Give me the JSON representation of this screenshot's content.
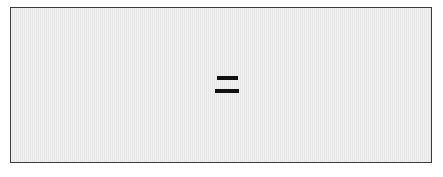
{
  "panel": {
    "name": "equals-panel",
    "background_color": "#e8e8e8",
    "border_color": "#3a3a3a",
    "outer_background_color": "#ffffff",
    "width_px": 443,
    "height_px": 177
  },
  "content": {
    "symbol": "=",
    "symbol_name": "equals-icon",
    "symbol_color": "#111111",
    "bars": [
      {
        "name": "equals-bar-top",
        "width_px": 21,
        "height_px": 4
      },
      {
        "name": "equals-bar-bottom",
        "width_px": 24,
        "height_px": 4
      }
    ]
  }
}
